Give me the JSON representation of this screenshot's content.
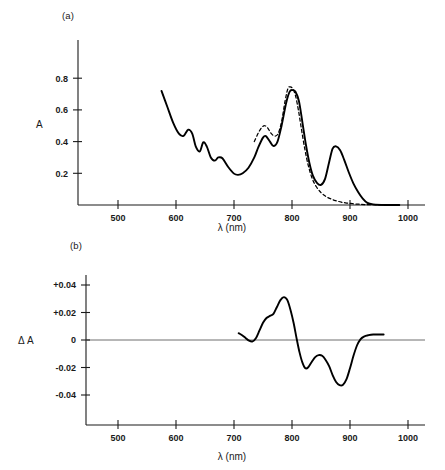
{
  "figure": {
    "panel_a_label": "(a)",
    "panel_b_label": "(b)",
    "xlabel": "λ (nm)",
    "ylabel_a": "A",
    "ylabel_b": "Δ A"
  },
  "chart_data": [
    {
      "type": "line",
      "panel": "(a)",
      "title": "",
      "xlabel": "λ (nm)",
      "ylabel": "A",
      "xlim": [
        430,
        1010
      ],
      "ylim": [
        0,
        0.92
      ],
      "xticks": [
        500,
        600,
        700,
        800,
        900,
        1000
      ],
      "yticks": [
        0.2,
        0.4,
        0.6,
        0.8
      ],
      "grid": false,
      "legend": false,
      "series": [
        {
          "name": "solid",
          "style": "solid",
          "x": [
            575,
            585,
            595,
            605,
            613,
            621,
            628,
            634,
            641,
            647,
            653,
            660,
            667,
            673,
            680,
            690,
            700,
            707,
            715,
            725,
            735,
            742,
            750,
            755,
            762,
            768,
            775,
            782,
            790,
            796,
            801,
            806,
            812,
            818,
            824,
            830,
            836,
            843,
            850,
            857,
            864,
            870,
            876,
            883,
            890,
            898,
            906,
            914,
            922,
            930,
            940,
            960,
            985
          ],
          "y": [
            0.72,
            0.62,
            0.52,
            0.45,
            0.436,
            0.475,
            0.45,
            0.37,
            0.338,
            0.395,
            0.37,
            0.3,
            0.28,
            0.3,
            0.295,
            0.24,
            0.198,
            0.19,
            0.2,
            0.235,
            0.3,
            0.365,
            0.425,
            0.435,
            0.4,
            0.372,
            0.4,
            0.5,
            0.645,
            0.715,
            0.725,
            0.715,
            0.655,
            0.52,
            0.38,
            0.265,
            0.185,
            0.14,
            0.127,
            0.165,
            0.27,
            0.355,
            0.37,
            0.345,
            0.285,
            0.205,
            0.135,
            0.082,
            0.04,
            0.013,
            0.004,
            0.0,
            0.0
          ]
        },
        {
          "name": "dashed",
          "style": "dashed",
          "x": [
            735,
            742,
            748,
            753,
            758,
            764,
            770,
            776,
            782,
            788,
            793,
            797,
            801,
            806,
            811,
            816,
            822,
            828,
            835,
            842,
            850,
            858,
            866,
            875,
            885,
            895,
            905,
            915,
            925,
            940,
            960,
            985
          ],
          "y": [
            0.4,
            0.455,
            0.49,
            0.5,
            0.487,
            0.452,
            0.435,
            0.45,
            0.525,
            0.655,
            0.735,
            0.745,
            0.735,
            0.69,
            0.6,
            0.485,
            0.355,
            0.25,
            0.165,
            0.115,
            0.078,
            0.055,
            0.04,
            0.028,
            0.018,
            0.012,
            0.008,
            0.005,
            0.003,
            0.002,
            0.0,
            0.0
          ]
        }
      ]
    },
    {
      "type": "line",
      "panel": "(b)",
      "title": "",
      "xlabel": "λ (nm)",
      "ylabel": "Δ A",
      "xlim": [
        430,
        1010
      ],
      "ylim": [
        -0.055,
        0.052
      ],
      "xticks": [
        500,
        600,
        700,
        800,
        900,
        1000
      ],
      "yticks": [
        0.04,
        0.02,
        0,
        -0.02,
        -0.04
      ],
      "ytick_labels": [
        "+0.04",
        "+0.02",
        "0",
        "-0.02",
        "-0.04"
      ],
      "grid": false,
      "legend": false,
      "zero_line": true,
      "series": [
        {
          "name": "delta-a",
          "style": "solid",
          "x": [
            708,
            714,
            720,
            726,
            732,
            738,
            744,
            750,
            756,
            762,
            768,
            774,
            780,
            786,
            792,
            798,
            803,
            808,
            813,
            818,
            823,
            828,
            834,
            840,
            846,
            852,
            858,
            864,
            870,
            876,
            882,
            888,
            894,
            900,
            906,
            912,
            918,
            924,
            932,
            940,
            950,
            958
          ],
          "y": [
            0.005,
            0.0035,
            0.0015,
            -0.0005,
            -0.001,
            0.0015,
            0.007,
            0.0125,
            0.016,
            0.0175,
            0.019,
            0.024,
            0.029,
            0.0312,
            0.029,
            0.021,
            0.012,
            0.001,
            -0.009,
            -0.0165,
            -0.0205,
            -0.0198,
            -0.016,
            -0.0125,
            -0.011,
            -0.0115,
            -0.0145,
            -0.019,
            -0.0255,
            -0.0305,
            -0.0328,
            -0.0325,
            -0.0285,
            -0.0205,
            -0.0115,
            -0.004,
            0.0005,
            0.0025,
            0.0035,
            0.004,
            0.004,
            0.004
          ]
        }
      ]
    }
  ]
}
